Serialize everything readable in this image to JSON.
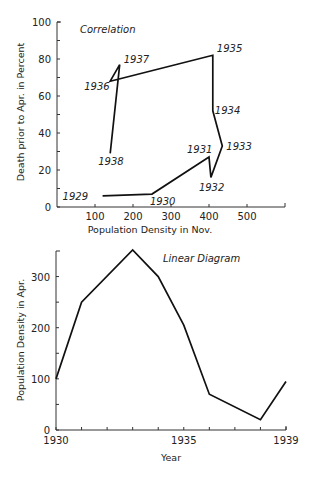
{
  "chart_data": [
    {
      "type": "line",
      "title": "Correlation",
      "xlabel": "Population Density in Nov.",
      "ylabel": "Death prior to Apr. in Percent",
      "xlim": [
        0,
        600
      ],
      "ylim": [
        0,
        100
      ],
      "x_ticks": [
        100,
        200,
        300,
        400,
        500
      ],
      "y_ticks": [
        0,
        20,
        40,
        60,
        80,
        100
      ],
      "grid": false,
      "series": [
        {
          "name": "Correlation path",
          "points": [
            {
              "label": "1929",
              "x": 120,
              "y": 6
            },
            {
              "label": "1930",
              "x": 250,
              "y": 7
            },
            {
              "label": "1931",
              "x": 400,
              "y": 27
            },
            {
              "label": "1932",
              "x": 405,
              "y": 16
            },
            {
              "label": "1933",
              "x": 435,
              "y": 33
            },
            {
              "label": "1934",
              "x": 410,
              "y": 52
            },
            {
              "label": "1935",
              "x": 410,
              "y": 82
            },
            {
              "label": "1936",
              "x": 140,
              "y": 68
            },
            {
              "label": "1937",
              "x": 165,
              "y": 77
            },
            {
              "label": "1938",
              "x": 140,
              "y": 29
            }
          ]
        }
      ]
    },
    {
      "type": "line",
      "title": "Linear Diagram",
      "xlabel": "Year",
      "ylabel": "Population Density in Apr.",
      "xlim": [
        1930,
        1939
      ],
      "ylim": [
        0,
        350
      ],
      "x_tick_labels": [
        "1930",
        "1935",
        "1939"
      ],
      "x_ticks": [
        1930,
        1931,
        1932,
        1933,
        1934,
        1935,
        1936,
        1937,
        1938,
        1939
      ],
      "y_ticks": [
        0,
        100,
        200,
        300
      ],
      "grid": false,
      "series": [
        {
          "name": "Population Density in Apr.",
          "x": [
            1930,
            1931,
            1933,
            1934,
            1935,
            1936,
            1938,
            1939
          ],
          "values": [
            100,
            250,
            352,
            300,
            205,
            70,
            20,
            95
          ]
        }
      ]
    }
  ]
}
